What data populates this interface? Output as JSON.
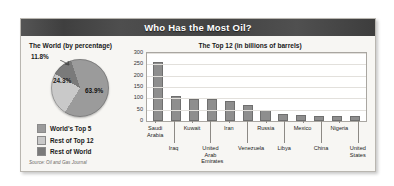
{
  "header": {
    "title": "Who Has the Most Oil?"
  },
  "pie_panel": {
    "title": "The World (by percentage)",
    "source": "Source: Oil and Gas Journal",
    "legend": [
      {
        "label": "World's Top 5",
        "color": "#9b9b9b"
      },
      {
        "label": "Rest of Top 12",
        "color": "#c9c9c9"
      },
      {
        "label": "Rest of World",
        "color": "#7a7a7a"
      }
    ]
  },
  "bar_panel": {
    "title": "The Top 12 (in billions of barrels)"
  },
  "chart_data": [
    {
      "type": "pie",
      "title": "The World (by percentage)",
      "labels": [
        "World's Top 5",
        "Rest of Top 12",
        "Rest of World"
      ],
      "values": [
        63.9,
        24.3,
        11.8
      ],
      "value_labels": [
        "63.9%",
        "24.3%",
        "11.8%"
      ],
      "colors": [
        "#9b9b9b",
        "#c9c9c9",
        "#7a7a7a"
      ],
      "legend_position": "bottom-left",
      "source": "Source: Oil and Gas Journal"
    },
    {
      "type": "bar",
      "title": "The Top 12 (in billions of barrels)",
      "xlabel": "",
      "ylabel": "",
      "ylim": [
        0,
        300
      ],
      "yticks": [
        0,
        50,
        100,
        150,
        200,
        250,
        300
      ],
      "grid": true,
      "bar_color": "#8e8e8e",
      "categories": [
        "Saudi Arabia",
        "Iraq",
        "Kuwait",
        "United Arab Emirates",
        "Iran",
        "Venezuela",
        "Russia",
        "Libya",
        "Mexico",
        "China",
        "Nigeria",
        "United States"
      ],
      "values": [
        261,
        112,
        96,
        97,
        90,
        72,
        48,
        29,
        26,
        24,
        24,
        22
      ]
    }
  ]
}
